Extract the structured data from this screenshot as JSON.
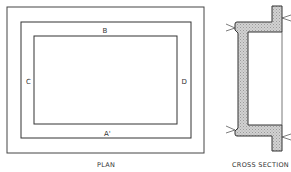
{
  "plan": {
    "title": "PLAN",
    "labels": {
      "top": "B",
      "left": "C",
      "right": "D",
      "bottom": "A'"
    }
  },
  "cross_section": {
    "title": "CROSS SECTION"
  },
  "colors": {
    "line": "#333333",
    "hatch_fill": "#c8c8c8",
    "background": "#ffffff"
  }
}
